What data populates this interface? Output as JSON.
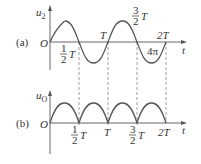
{
  "figure": {
    "panels": [
      {
        "id": "a",
        "tag": "(a)",
        "y_label_main": "u",
        "y_label_sub": "2",
        "origin_label": "O",
        "x_label": "t",
        "waveform": "sine",
        "tick_labels": {
          "half_T": {
            "num": "1",
            "den": "2",
            "sym": "T"
          },
          "T": "T",
          "three_half_T": {
            "num": "3",
            "den": "2",
            "sym": "T"
          },
          "two_T": "2T",
          "four_pi": "4π"
        }
      },
      {
        "id": "b",
        "tag": "(b)",
        "y_label_main": "u",
        "y_label_sub": "O",
        "origin_label": "O",
        "x_label": "t",
        "waveform": "full-wave rectified sine",
        "tick_labels": {
          "half_T": {
            "num": "1",
            "den": "2",
            "sym": "T"
          },
          "T": "T",
          "three_half_T": {
            "num": "3",
            "den": "2",
            "sym": "T"
          },
          "two_T": "2T"
        }
      }
    ]
  },
  "colors": {
    "line": "#555555",
    "text": "#333333",
    "background": "#ffffff"
  }
}
